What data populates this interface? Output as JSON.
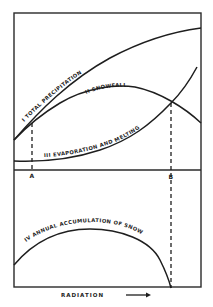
{
  "diagram": {
    "curves": [
      {
        "id": "I",
        "label": "I  TOTAL PRECIPITATION"
      },
      {
        "id": "II",
        "label": "II  SNOWFALL"
      },
      {
        "id": "III",
        "label": "III  EVAPORATION AND MELTING"
      },
      {
        "id": "IV",
        "label": "IV  ANNUAL ACCUMULATION OF SNOW"
      }
    ],
    "points": {
      "a": "A",
      "b": "B"
    },
    "x_axis_label": "RADIATION",
    "x_axis_arrow": "→",
    "colors": {
      "ink": "#1e1e1e",
      "background": "#ffffff"
    }
  }
}
